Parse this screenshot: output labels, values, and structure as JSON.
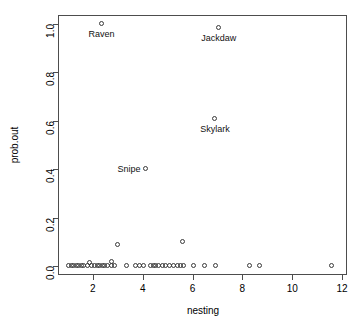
{
  "chart_data": {
    "type": "scatter",
    "title": "",
    "xlabel": "nesting",
    "ylabel": "prob.out",
    "xlim": [
      0.6,
      12.2
    ],
    "ylim": [
      -0.035,
      1.035
    ],
    "grid": false,
    "legend": null,
    "marker": "open-circle",
    "xticks": [
      2,
      4,
      6,
      8,
      10,
      12
    ],
    "xticklabels": [
      "2",
      "4",
      "6",
      "8",
      "10",
      "12"
    ],
    "yticks": [
      0.0,
      0.2,
      0.4,
      0.6,
      0.8,
      1.0
    ],
    "yticklabels": [
      "0.0",
      "0.2",
      "0.4",
      "0.6",
      "0.8",
      "1.0"
    ],
    "points": [
      {
        "x": 2.35,
        "y": 1.0
      },
      {
        "x": 7.05,
        "y": 0.98
      },
      {
        "x": 6.9,
        "y": 0.605
      },
      {
        "x": 4.15,
        "y": 0.4
      },
      {
        "x": 3.0,
        "y": 0.09
      },
      {
        "x": 5.6,
        "y": 0.1
      },
      {
        "x": 2.75,
        "y": 0.02
      },
      {
        "x": 1.9,
        "y": 0.015
      },
      {
        "x": 1.05,
        "y": 0.0
      },
      {
        "x": 1.15,
        "y": 0.0
      },
      {
        "x": 1.25,
        "y": 0.0
      },
      {
        "x": 1.35,
        "y": 0.0
      },
      {
        "x": 1.45,
        "y": 0.0
      },
      {
        "x": 1.55,
        "y": 0.0
      },
      {
        "x": 1.65,
        "y": 0.0
      },
      {
        "x": 1.8,
        "y": 0.0
      },
      {
        "x": 1.95,
        "y": 0.0
      },
      {
        "x": 2.1,
        "y": 0.0
      },
      {
        "x": 2.2,
        "y": 0.0
      },
      {
        "x": 2.3,
        "y": 0.0
      },
      {
        "x": 2.4,
        "y": 0.0
      },
      {
        "x": 2.5,
        "y": 0.0
      },
      {
        "x": 2.6,
        "y": 0.0
      },
      {
        "x": 2.75,
        "y": 0.0
      },
      {
        "x": 2.9,
        "y": 0.0
      },
      {
        "x": 3.35,
        "y": 0.0
      },
      {
        "x": 3.75,
        "y": 0.0
      },
      {
        "x": 3.9,
        "y": 0.0
      },
      {
        "x": 4.05,
        "y": 0.0
      },
      {
        "x": 4.35,
        "y": 0.0
      },
      {
        "x": 4.45,
        "y": 0.0
      },
      {
        "x": 4.55,
        "y": 0.0
      },
      {
        "x": 4.65,
        "y": 0.0
      },
      {
        "x": 4.8,
        "y": 0.0
      },
      {
        "x": 4.95,
        "y": 0.0
      },
      {
        "x": 5.1,
        "y": 0.0
      },
      {
        "x": 5.25,
        "y": 0.0
      },
      {
        "x": 5.4,
        "y": 0.0
      },
      {
        "x": 5.55,
        "y": 0.0
      },
      {
        "x": 5.65,
        "y": 0.0
      },
      {
        "x": 6.05,
        "y": 0.0
      },
      {
        "x": 6.5,
        "y": 0.0
      },
      {
        "x": 6.95,
        "y": 0.0
      },
      {
        "x": 8.3,
        "y": 0.0
      },
      {
        "x": 8.7,
        "y": 0.0
      },
      {
        "x": 11.6,
        "y": 0.0
      }
    ],
    "annotations": [
      {
        "text": "Raven",
        "x": 2.35,
        "y": 1.0,
        "placement": "below"
      },
      {
        "text": "Jackdaw",
        "x": 7.05,
        "y": 0.98,
        "placement": "below"
      },
      {
        "text": "Skylark",
        "x": 6.9,
        "y": 0.605,
        "placement": "below"
      },
      {
        "text": "Snipe",
        "x": 4.15,
        "y": 0.4,
        "placement": "left"
      }
    ]
  },
  "axes": {
    "x_label": "nesting",
    "y_label": "prob.out"
  }
}
